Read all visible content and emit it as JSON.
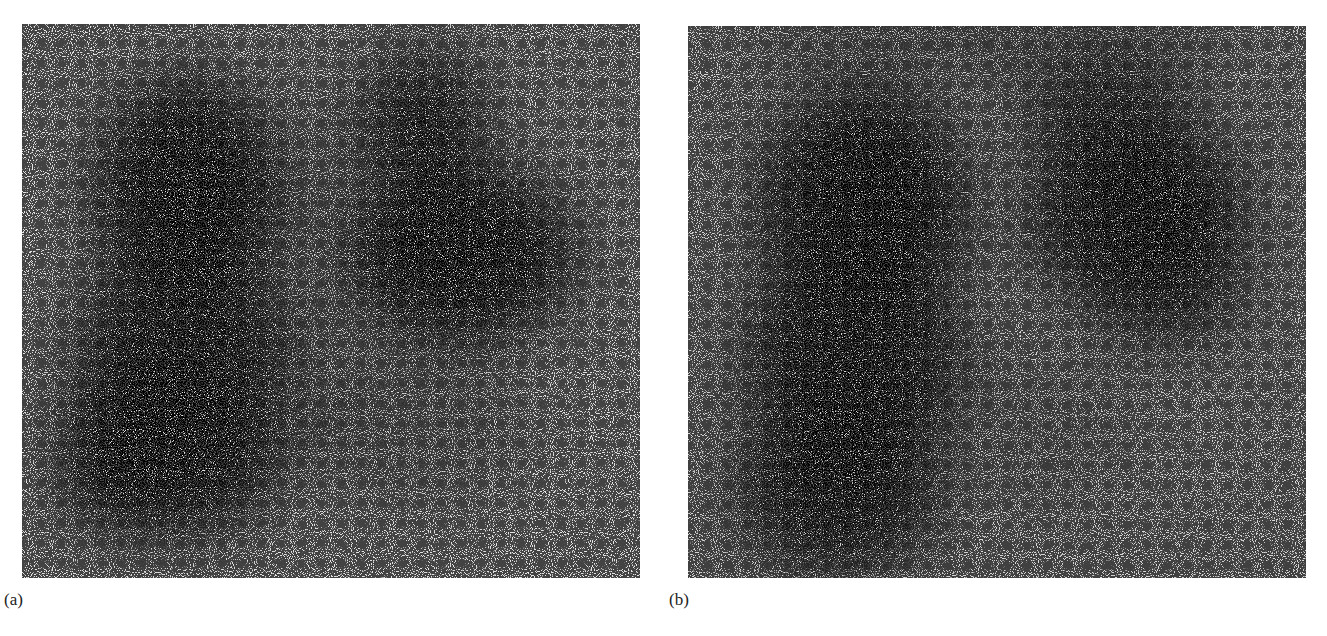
{
  "figure": {
    "panels": [
      {
        "label": "(a)",
        "background": "#e3e3e3",
        "description": "Scintigraphy image: two lung fields, left column tall with upper and lower dense regions, right field upper with dense center"
      },
      {
        "label": "(b)",
        "background": "#d9d9d9",
        "description": "Scintigraphy image: tall left lung field, right lung field upper with diffuse lower-right tail"
      }
    ]
  },
  "colors": {
    "page_background": "#ffffff",
    "dot_color": "#111111",
    "label_color": "#222222"
  }
}
